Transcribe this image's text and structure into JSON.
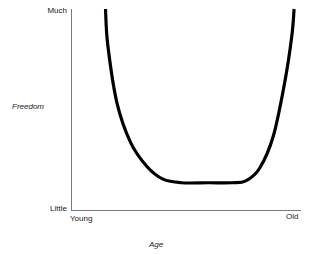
{
  "chart_data": {
    "type": "line",
    "title": "",
    "xlabel": "Age",
    "ylabel": "Freedom",
    "xlim": [
      "Young",
      "Old"
    ],
    "ylim": [
      "Little",
      "Much"
    ],
    "x_tick_labels": [
      "Young",
      "Old"
    ],
    "y_tick_labels": [
      "Little",
      "Much"
    ],
    "grid": false,
    "legend": false,
    "series": [
      {
        "name": "Freedom over lifetime",
        "description": "U-shaped curve: high freedom when young, minimal through middle age, rising again when old",
        "points": [
          {
            "x": 0.15,
            "y": 1.0
          },
          {
            "x": 0.16,
            "y": 0.8
          },
          {
            "x": 0.2,
            "y": 0.48
          },
          {
            "x": 0.26,
            "y": 0.26
          },
          {
            "x": 0.33,
            "y": 0.13
          },
          {
            "x": 0.4,
            "y": 0.06
          },
          {
            "x": 0.48,
            "y": 0.04
          },
          {
            "x": 0.6,
            "y": 0.04
          },
          {
            "x": 0.7,
            "y": 0.04
          },
          {
            "x": 0.76,
            "y": 0.05
          },
          {
            "x": 0.82,
            "y": 0.12
          },
          {
            "x": 0.88,
            "y": 0.3
          },
          {
            "x": 0.93,
            "y": 0.6
          },
          {
            "x": 0.96,
            "y": 0.85
          },
          {
            "x": 0.97,
            "y": 1.0
          }
        ]
      }
    ],
    "colors": {
      "curve": "#000000",
      "axis": "#7a7a7a",
      "text": "#1a1a1a",
      "background": "#ffffff"
    }
  },
  "axes": {
    "y_title": "Freedom",
    "x_title": "Age",
    "y_top_label": "Much",
    "y_bottom_label": "Little",
    "x_left_label": "Young",
    "x_right_label": "Old"
  }
}
